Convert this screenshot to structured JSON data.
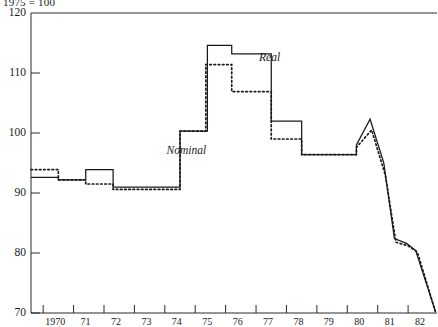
{
  "chart_data": {
    "type": "line",
    "title": "1975 = 100",
    "xlabel": "",
    "ylabel": "",
    "xlim": [
      1969.6,
      1982.95
    ],
    "ylim": [
      70,
      120
    ],
    "yticks": [
      70,
      80,
      90,
      100,
      110,
      120
    ],
    "ytick_labels": [
      "70",
      "80",
      "90",
      "100",
      "110",
      "120"
    ],
    "xticks": [
      1970,
      1971,
      1972,
      1973,
      1974,
      1975,
      1976,
      1977,
      1978,
      1979,
      1980,
      1981,
      1982
    ],
    "xtick_labels": [
      "1970",
      "71",
      "72",
      "73",
      "74",
      "75",
      "76",
      "77",
      "78",
      "79",
      "80",
      "81",
      "82"
    ],
    "grid": false,
    "legend_position": "inline-annotations",
    "series": [
      {
        "name": "Real",
        "style": "solid",
        "color": "#1a1a1a",
        "label_x": 1977.1,
        "label_y": 112.5,
        "points": [
          [
            1969.6,
            92.6
          ],
          [
            1970.5,
            92.6
          ],
          [
            1970.5,
            92.2
          ],
          [
            1971.4,
            92.2
          ],
          [
            1971.4,
            93.9
          ],
          [
            1972.3,
            93.9
          ],
          [
            1972.3,
            91.0
          ],
          [
            1974.5,
            91.0
          ],
          [
            1974.5,
            100.3
          ],
          [
            1975.4,
            100.3
          ],
          [
            1975.4,
            114.6
          ],
          [
            1976.2,
            114.6
          ],
          [
            1976.2,
            113.2
          ],
          [
            1977.5,
            113.2
          ],
          [
            1977.5,
            102.0
          ],
          [
            1978.5,
            102.0
          ],
          [
            1978.5,
            96.4
          ],
          [
            1980.3,
            96.4
          ],
          [
            1980.3,
            98.0
          ],
          [
            1980.75,
            102.3
          ],
          [
            1980.75,
            102.3
          ],
          [
            1981.2,
            95.0
          ],
          [
            1981.2,
            95.0
          ],
          [
            1981.55,
            82.4
          ],
          [
            1981.55,
            82.4
          ],
          [
            1981.95,
            81.6
          ],
          [
            1981.95,
            81.6
          ],
          [
            1982.25,
            80.4
          ],
          [
            1982.25,
            80.4
          ],
          [
            1982.9,
            70.2
          ]
        ]
      },
      {
        "name": "Nominal",
        "style": "dotted",
        "color": "#1a1a1a",
        "label_x": 1975.9,
        "label_y": 97.0,
        "points": [
          [
            1969.6,
            93.9
          ],
          [
            1970.5,
            93.9
          ],
          [
            1970.5,
            92.2
          ],
          [
            1971.4,
            92.2
          ],
          [
            1971.4,
            91.5
          ],
          [
            1972.3,
            91.5
          ],
          [
            1972.3,
            90.6
          ],
          [
            1974.5,
            90.6
          ],
          [
            1974.5,
            100.3
          ],
          [
            1975.35,
            100.3
          ],
          [
            1975.35,
            111.4
          ],
          [
            1976.2,
            111.4
          ],
          [
            1976.2,
            106.9
          ],
          [
            1977.5,
            106.9
          ],
          [
            1977.5,
            99.0
          ],
          [
            1978.5,
            99.0
          ],
          [
            1978.5,
            96.4
          ],
          [
            1980.3,
            96.4
          ],
          [
            1980.3,
            97.6
          ],
          [
            1980.8,
            100.5
          ],
          [
            1980.8,
            100.5
          ],
          [
            1981.25,
            93.0
          ],
          [
            1981.25,
            93.0
          ],
          [
            1981.6,
            81.8
          ],
          [
            1981.6,
            81.8
          ],
          [
            1982.0,
            81.2
          ],
          [
            1982.0,
            81.2
          ],
          [
            1982.3,
            80.2
          ],
          [
            1982.3,
            80.2
          ],
          [
            1982.9,
            70.2
          ]
        ]
      }
    ]
  }
}
